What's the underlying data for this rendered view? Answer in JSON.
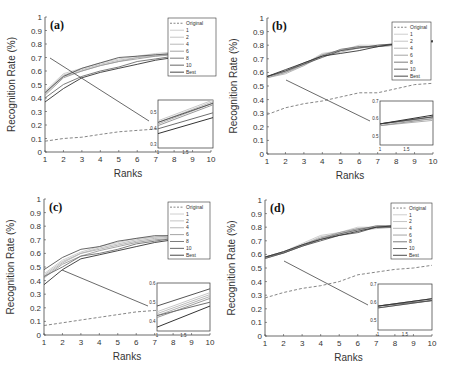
{
  "figure": {
    "width": 449,
    "height": 375
  },
  "chart_data": [
    {
      "panel": "(a)",
      "type": "line",
      "xlabel": "Ranks",
      "ylabel": "Recognition Rate (%)",
      "x": [
        1,
        2,
        3,
        4,
        5,
        6,
        7,
        8,
        9,
        10
      ],
      "xlim": [
        1,
        10
      ],
      "ylim": [
        0,
        1
      ],
      "yticks": [
        "0",
        "0.1",
        "0.2",
        "0.3",
        "0.4",
        "0.5",
        "0.6",
        "0.7",
        "0.8",
        "0.9",
        "1"
      ],
      "xticks": [
        "1",
        "2",
        "3",
        "4",
        "5",
        "6",
        "7",
        "8",
        "9",
        "10"
      ],
      "legend": [
        "Original",
        "1",
        "2",
        "4",
        "6",
        "8",
        "10",
        "Best"
      ],
      "legend_position": "upper right",
      "series": [
        {
          "name": "Original",
          "style": "dashed",
          "color": "#777777",
          "values": [
            0.08,
            0.1,
            0.11,
            0.13,
            0.15,
            0.16,
            0.17,
            0.18,
            0.19,
            0.2
          ]
        },
        {
          "name": "1",
          "color": "#c8c8c8",
          "values": [
            0.45,
            0.58,
            0.62,
            0.66,
            0.69,
            0.71,
            0.73,
            0.74,
            0.74,
            0.75
          ]
        },
        {
          "name": "2",
          "color": "#bdbdbd",
          "values": [
            0.44,
            0.57,
            0.61,
            0.65,
            0.68,
            0.7,
            0.72,
            0.73,
            0.74,
            0.74
          ]
        },
        {
          "name": "4",
          "color": "#b0b0b0",
          "values": [
            0.43,
            0.56,
            0.6,
            0.64,
            0.67,
            0.7,
            0.71,
            0.73,
            0.73,
            0.74
          ]
        },
        {
          "name": "6",
          "color": "#9a9a9a",
          "values": [
            0.42,
            0.55,
            0.6,
            0.64,
            0.67,
            0.69,
            0.71,
            0.72,
            0.73,
            0.74
          ]
        },
        {
          "name": "8",
          "color": "#6e6e6e",
          "values": [
            0.4,
            0.5,
            0.56,
            0.6,
            0.63,
            0.67,
            0.69,
            0.71,
            0.72,
            0.73
          ]
        },
        {
          "name": "10",
          "color": "#555555",
          "values": [
            0.44,
            0.56,
            0.62,
            0.66,
            0.7,
            0.71,
            0.72,
            0.73,
            0.73,
            0.74
          ]
        },
        {
          "name": "Best",
          "color": "#333333",
          "values": [
            0.37,
            0.47,
            0.55,
            0.59,
            0.62,
            0.65,
            0.68,
            0.7,
            0.71,
            0.72
          ]
        }
      ],
      "inset": {
        "xticks": [
          "1",
          "1.5"
        ],
        "yticks": [
          "0.3",
          "0.4",
          "0.5"
        ],
        "xlim": [
          1,
          2
        ],
        "ylim": [
          0.28,
          0.58
        ]
      }
    },
    {
      "panel": "(b)",
      "type": "line",
      "xlabel": "Ranks",
      "ylabel": "Recognition Rate (%)",
      "x": [
        1,
        2,
        3,
        4,
        5,
        6,
        7,
        8,
        9,
        10
      ],
      "xlim": [
        1,
        10
      ],
      "ylim": [
        0,
        1
      ],
      "yticks": [
        "0",
        "0.1",
        "0.2",
        "0.3",
        "0.4",
        "0.5",
        "0.6",
        "0.7",
        "0.8",
        "0.9",
        "1"
      ],
      "xticks": [
        "1",
        "2",
        "3",
        "4",
        "5",
        "6",
        "7",
        "8",
        "9",
        "10"
      ],
      "legend": [
        "Original",
        "1",
        "2",
        "4",
        "6",
        "8",
        "10",
        "Best"
      ],
      "legend_position": "upper right",
      "series": [
        {
          "name": "Original",
          "style": "dashed",
          "color": "#777777",
          "values": [
            0.29,
            0.34,
            0.37,
            0.39,
            0.42,
            0.45,
            0.45,
            0.48,
            0.51,
            0.52
          ]
        },
        {
          "name": "1",
          "color": "#c8c8c8",
          "values": [
            0.57,
            0.6,
            0.66,
            0.74,
            0.76,
            0.8,
            0.8,
            0.81,
            0.82,
            0.83
          ]
        },
        {
          "name": "2",
          "color": "#bdbdbd",
          "values": [
            0.57,
            0.6,
            0.65,
            0.73,
            0.76,
            0.79,
            0.79,
            0.81,
            0.82,
            0.83
          ]
        },
        {
          "name": "4",
          "color": "#b0b0b0",
          "values": [
            0.56,
            0.59,
            0.65,
            0.72,
            0.75,
            0.78,
            0.79,
            0.8,
            0.82,
            0.82
          ]
        },
        {
          "name": "6",
          "color": "#9a9a9a",
          "values": [
            0.56,
            0.6,
            0.66,
            0.73,
            0.76,
            0.78,
            0.79,
            0.8,
            0.82,
            0.83
          ]
        },
        {
          "name": "8",
          "color": "#6e6e6e",
          "values": [
            0.57,
            0.61,
            0.67,
            0.72,
            0.77,
            0.79,
            0.79,
            0.81,
            0.82,
            0.83
          ]
        },
        {
          "name": "10",
          "color": "#555555",
          "values": [
            0.57,
            0.61,
            0.66,
            0.71,
            0.76,
            0.78,
            0.8,
            0.81,
            0.82,
            0.83
          ]
        },
        {
          "name": "Best",
          "color": "#333333",
          "values": [
            0.57,
            0.62,
            0.67,
            0.72,
            0.74,
            0.76,
            0.79,
            0.81,
            0.82,
            0.83
          ]
        }
      ],
      "inset": {
        "xticks": [
          "1",
          "1.5"
        ],
        "yticks": [
          "0.5",
          "0.6",
          "0.7"
        ],
        "xlim": [
          1,
          2
        ],
        "ylim": [
          0.45,
          0.7
        ]
      }
    },
    {
      "panel": "(c)",
      "type": "line",
      "xlabel": "Ranks",
      "ylabel": "Recognition Rate (%)",
      "x": [
        1,
        2,
        3,
        4,
        5,
        6,
        7,
        8,
        9,
        10
      ],
      "xlim": [
        1,
        10
      ],
      "ylim": [
        0,
        1
      ],
      "yticks": [
        "0",
        "0.1",
        "0.2",
        "0.3",
        "0.4",
        "0.5",
        "0.6",
        "0.7",
        "0.8",
        "0.9",
        "1"
      ],
      "xticks": [
        "1",
        "2",
        "3",
        "4",
        "5",
        "6",
        "7",
        "8",
        "9",
        "10"
      ],
      "legend": [
        "Original",
        "1",
        "2",
        "4",
        "6",
        "8",
        "10",
        "Best"
      ],
      "legend_position": "upper right",
      "series": [
        {
          "name": "Original",
          "style": "dashed",
          "color": "#777777",
          "values": [
            0.07,
            0.09,
            0.11,
            0.13,
            0.15,
            0.17,
            0.18,
            0.19,
            0.2,
            0.21
          ]
        },
        {
          "name": "1",
          "color": "#c8c8c8",
          "values": [
            0.45,
            0.55,
            0.61,
            0.65,
            0.68,
            0.71,
            0.72,
            0.73,
            0.73,
            0.74
          ]
        },
        {
          "name": "2",
          "color": "#bdbdbd",
          "values": [
            0.44,
            0.54,
            0.6,
            0.64,
            0.67,
            0.7,
            0.72,
            0.73,
            0.73,
            0.74
          ]
        },
        {
          "name": "4",
          "color": "#b0b0b0",
          "values": [
            0.43,
            0.53,
            0.6,
            0.63,
            0.66,
            0.69,
            0.71,
            0.72,
            0.73,
            0.73
          ]
        },
        {
          "name": "6",
          "color": "#9a9a9a",
          "values": [
            0.42,
            0.52,
            0.58,
            0.62,
            0.65,
            0.68,
            0.7,
            0.71,
            0.72,
            0.73
          ]
        },
        {
          "name": "8",
          "color": "#6e6e6e",
          "values": [
            0.43,
            0.5,
            0.58,
            0.6,
            0.63,
            0.67,
            0.69,
            0.71,
            0.72,
            0.73
          ]
        },
        {
          "name": "10",
          "color": "#555555",
          "values": [
            0.48,
            0.57,
            0.63,
            0.65,
            0.69,
            0.71,
            0.73,
            0.73,
            0.74,
            0.74
          ]
        },
        {
          "name": "Best",
          "color": "#333333",
          "values": [
            0.37,
            0.48,
            0.56,
            0.59,
            0.62,
            0.65,
            0.68,
            0.7,
            0.71,
            0.72
          ]
        }
      ],
      "inset": {
        "xticks": [
          "1",
          "1.5"
        ],
        "yticks": [
          "0.4",
          "0.5",
          "0.6"
        ],
        "xlim": [
          1,
          2
        ],
        "ylim": [
          0.35,
          0.6
        ]
      }
    },
    {
      "panel": "(d)",
      "type": "line",
      "xlabel": "Ranks",
      "ylabel": "Recognition Rate (%)",
      "x": [
        1,
        2,
        3,
        4,
        5,
        6,
        7,
        8,
        9,
        10
      ],
      "xlim": [
        1,
        10
      ],
      "ylim": [
        0,
        1
      ],
      "yticks": [
        "0",
        "0.1",
        "0.2",
        "0.3",
        "0.4",
        "0.5",
        "0.6",
        "0.7",
        "0.8",
        "0.9",
        "1"
      ],
      "xticks": [
        "1",
        "2",
        "3",
        "4",
        "5",
        "6",
        "7",
        "8",
        "9",
        "10"
      ],
      "legend": [
        "Original",
        "1",
        "2",
        "4",
        "6",
        "8",
        "10",
        "Best"
      ],
      "legend_position": "upper right",
      "series": [
        {
          "name": "Original",
          "style": "dashed",
          "color": "#777777",
          "values": [
            0.28,
            0.32,
            0.35,
            0.37,
            0.4,
            0.45,
            0.47,
            0.49,
            0.5,
            0.52
          ]
        },
        {
          "name": "1",
          "color": "#c8c8c8",
          "values": [
            0.58,
            0.62,
            0.68,
            0.74,
            0.76,
            0.8,
            0.8,
            0.81,
            0.82,
            0.83
          ]
        },
        {
          "name": "2",
          "color": "#bdbdbd",
          "values": [
            0.58,
            0.62,
            0.67,
            0.73,
            0.75,
            0.79,
            0.8,
            0.8,
            0.82,
            0.83
          ]
        },
        {
          "name": "4",
          "color": "#b0b0b0",
          "values": [
            0.57,
            0.61,
            0.67,
            0.72,
            0.75,
            0.78,
            0.79,
            0.8,
            0.81,
            0.82
          ]
        },
        {
          "name": "6",
          "color": "#9a9a9a",
          "values": [
            0.58,
            0.62,
            0.67,
            0.72,
            0.76,
            0.79,
            0.8,
            0.81,
            0.82,
            0.83
          ]
        },
        {
          "name": "8",
          "color": "#6e6e6e",
          "values": [
            0.58,
            0.61,
            0.66,
            0.71,
            0.75,
            0.78,
            0.81,
            0.81,
            0.82,
            0.83
          ]
        },
        {
          "name": "10",
          "color": "#555555",
          "values": [
            0.57,
            0.61,
            0.66,
            0.7,
            0.74,
            0.76,
            0.8,
            0.8,
            0.82,
            0.83
          ]
        },
        {
          "name": "Best",
          "color": "#333333",
          "values": [
            0.58,
            0.62,
            0.67,
            0.71,
            0.74,
            0.77,
            0.8,
            0.81,
            0.82,
            0.83
          ]
        }
      ],
      "inset": {
        "xticks": [
          "1",
          "1.5"
        ],
        "yticks": [
          "0.5",
          "0.6",
          "0.7"
        ],
        "xlim": [
          1,
          2
        ],
        "ylim": [
          0.45,
          0.7
        ]
      }
    }
  ],
  "layout": [
    {
      "px0": 45,
      "px1": 211,
      "py0": 152,
      "py1": 17,
      "inset": {
        "x": 158,
        "y": 100,
        "w": 55,
        "h": 48
      },
      "legend": {
        "x": 168,
        "y": 18,
        "w": 48,
        "h": 58
      },
      "zoom_src": [
        50,
        58
      ],
      "zoom_dst": [
        149,
        121
      ]
    },
    {
      "px0": 267,
      "px1": 433,
      "py0": 154,
      "py1": 18,
      "inset": {
        "x": 380,
        "y": 101,
        "w": 53,
        "h": 44
      },
      "legend": {
        "x": 392,
        "y": 22,
        "w": 39,
        "h": 58
      },
      "zoom_src": [
        286,
        80
      ],
      "zoom_dst": [
        370,
        121
      ]
    },
    {
      "px0": 44,
      "px1": 210,
      "py0": 335,
      "py1": 199,
      "inset": {
        "x": 157,
        "y": 283,
        "w": 53,
        "h": 48
      },
      "legend": {
        "x": 168,
        "y": 202,
        "w": 42,
        "h": 57
      },
      "zoom_src": [
        62,
        270
      ],
      "zoom_dst": [
        148,
        306
      ]
    },
    {
      "px0": 265,
      "px1": 432,
      "py0": 336,
      "py1": 200,
      "inset": {
        "x": 378,
        "y": 284,
        "w": 54,
        "h": 46
      },
      "legend": {
        "x": 391,
        "y": 203,
        "w": 41,
        "h": 56
      },
      "zoom_src": [
        284,
        261
      ],
      "zoom_dst": [
        368,
        305
      ]
    }
  ]
}
